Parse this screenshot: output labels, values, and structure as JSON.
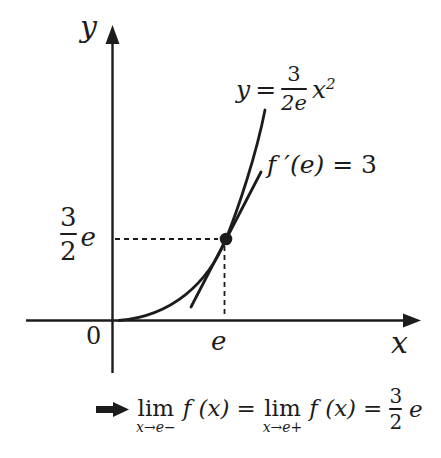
{
  "colors": {
    "ink": "#1c1c1c",
    "background": "#ffffff"
  },
  "graph": {
    "y_axis_label": "y",
    "x_axis_label": "x",
    "origin_label": "0",
    "x_tick_label": "e",
    "y_tick": {
      "numerator": "3",
      "denominator": "2",
      "suffix": "e"
    },
    "curve_equation": {
      "lhs": "y",
      "eq": "=",
      "numerator": "3",
      "denominator": "2e",
      "base": "x",
      "exponent": "2"
    },
    "tangent_label": {
      "func": "f ′(e)",
      "eq": " = 3"
    },
    "marked_point": {
      "x": "e",
      "y": "3/2 e"
    }
  },
  "conclusion": {
    "left_limit": {
      "op": "lim",
      "sub": "x→e−"
    },
    "left_expr": "f (x)",
    "eq1": "=",
    "right_limit": {
      "op": "lim",
      "sub": "x→e+"
    },
    "right_expr": "f (x)",
    "eq2": "=",
    "result_fraction": {
      "numerator": "3",
      "denominator": "2"
    },
    "result_suffix": "e"
  }
}
